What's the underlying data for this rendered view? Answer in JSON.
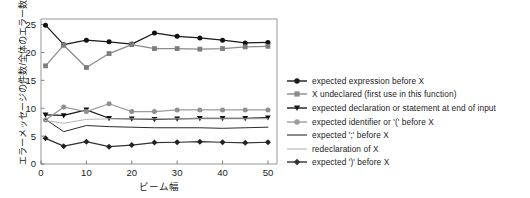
{
  "chart_data": {
    "type": "line",
    "title": "",
    "subtitle": "",
    "xlabel": "ビーム幅",
    "ylabel": "エラーメッセージの件数/全体のエラー数 (%)",
    "xlim": [
      0,
      52
    ],
    "ylim": [
      0,
      26
    ],
    "xticks": [
      0,
      10,
      20,
      30,
      40,
      50
    ],
    "yticks": [
      0,
      5,
      10,
      15,
      20,
      25
    ],
    "grid": false,
    "legend_position": "right",
    "x": [
      1,
      5,
      10,
      15,
      20,
      25,
      30,
      35,
      40,
      45,
      50
    ],
    "series": [
      {
        "name": "expected expression before X",
        "color": "#1a1a1a",
        "marker": "circle",
        "marker_color": "#111111",
        "values": [
          24.9,
          21.4,
          22.2,
          21.9,
          21.5,
          23.5,
          22.9,
          22.6,
          22.2,
          21.7,
          21.8
        ]
      },
      {
        "name": "X undeclared (first use in this function)",
        "color": "#8a8a8a",
        "marker": "square",
        "marker_color": "#7d7d7d",
        "values": [
          17.6,
          21.3,
          17.3,
          19.8,
          21.4,
          20.7,
          20.7,
          20.6,
          20.7,
          21.0,
          21.1
        ]
      },
      {
        "name": "expected declaration or statement at end of input",
        "color": "#1a1a1a",
        "marker": "triangle-down",
        "marker_color": "#111111",
        "values": [
          8.8,
          8.7,
          9.7,
          8.2,
          8.1,
          8.0,
          8.1,
          8.2,
          8.2,
          8.2,
          8.3
        ]
      },
      {
        "name": "expected identifier or   '('   before X",
        "color": "#9c9c9c",
        "marker": "circle",
        "marker_color": "#8f8f8f",
        "values": [
          7.9,
          10.2,
          9.4,
          10.8,
          9.4,
          9.4,
          9.7,
          9.7,
          9.7,
          9.7,
          9.7
        ]
      },
      {
        "name": "expected   ';'   before X",
        "color": "#2b2b2b",
        "marker": "none",
        "marker_color": "#2b2b2b",
        "values": [
          8.0,
          5.8,
          6.9,
          6.7,
          6.6,
          6.5,
          6.5,
          6.5,
          6.4,
          6.5,
          6.6
        ]
      },
      {
        "name": "redeclaration of X",
        "color": "#b5b5b5",
        "marker": "none",
        "marker_color": "#b5b5b5",
        "values": [
          7.8,
          7.3,
          8.0,
          8.1,
          8.1,
          8.1,
          8.1,
          8.1,
          8.1,
          8.1,
          8.1
        ]
      },
      {
        "name": "expected   ')'   before X",
        "color": "#333333",
        "marker": "diamond",
        "marker_color": "#222222",
        "values": [
          4.6,
          3.2,
          4.0,
          3.1,
          3.4,
          3.85,
          3.9,
          4.0,
          3.9,
          3.8,
          3.9
        ]
      }
    ]
  },
  "axes": {
    "x_tick_labels": [
      "0",
      "10",
      "20",
      "30",
      "40",
      "50"
    ],
    "y_tick_labels": [
      "0",
      "5",
      "10",
      "15",
      "20",
      "25"
    ],
    "x_title": "ビーム幅",
    "y_title": "エラーメッセージの件数/全体のエラー数 (%)"
  },
  "legend": {
    "items": [
      {
        "label": "expected expression before X",
        "marker": "circle",
        "color": "#1a1a1a"
      },
      {
        "label": "X undeclared (first use in this function)",
        "marker": "square",
        "color": "#8a8a8a"
      },
      {
        "label": "expected declaration or statement at end of input",
        "marker": "triangle-down",
        "color": "#1a1a1a"
      },
      {
        "label": "expected identifier or   '('   before X",
        "marker": "circle",
        "color": "#9c9c9c"
      },
      {
        "label": "expected   ';'   before X",
        "marker": "none",
        "color": "#2b2b2b"
      },
      {
        "label": "redeclaration of X",
        "marker": "none",
        "color": "#b5b5b5"
      },
      {
        "label": "expected   ')'   before X",
        "marker": "diamond",
        "color": "#333333"
      }
    ]
  }
}
